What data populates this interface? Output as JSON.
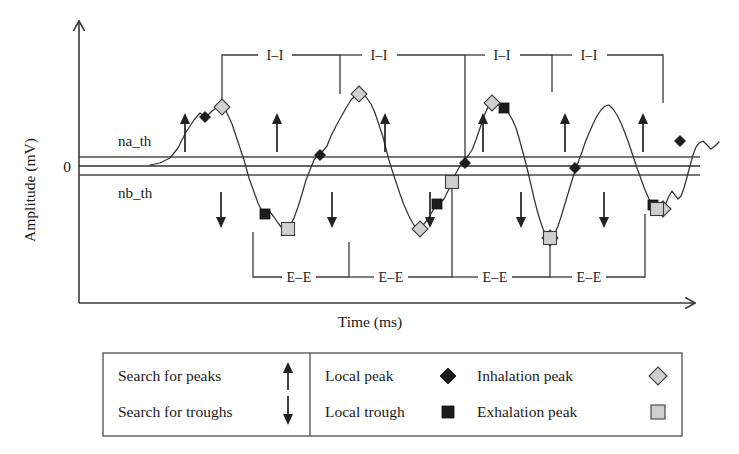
{
  "figure": {
    "type": "annotated-waveform"
  },
  "axes": {
    "y_title": "Amplitude (mV)",
    "x_title": "Time (ms)",
    "zero_tick_label": "0"
  },
  "thresholds": {
    "upper_label": "na_th",
    "lower_label": "nb_th"
  },
  "intervals": {
    "inhalation_label": "I–I",
    "exhalation_label": "E–E",
    "inhalation_count": 4,
    "exhalation_count": 4,
    "inhalation_items": [
      {
        "label": "I–I"
      },
      {
        "label": "I–I"
      },
      {
        "label": "I–I"
      },
      {
        "label": "I–I"
      }
    ],
    "exhalation_items": [
      {
        "label": "E–E"
      },
      {
        "label": "E–E"
      },
      {
        "label": "E–E"
      },
      {
        "label": "E–E"
      }
    ]
  },
  "legend": {
    "items": [
      {
        "label": "Search for peaks",
        "icon": "arrow-up-icon",
        "swatch": "arrow-up"
      },
      {
        "label": "Search for troughs",
        "icon": "arrow-down-icon",
        "swatch": "arrow-down"
      },
      {
        "label": "Local peak",
        "icon": "black-diamond-icon",
        "swatch": "dark-diamond"
      },
      {
        "label": "Local trough",
        "icon": "black-square-icon",
        "swatch": "dark-square"
      },
      {
        "label": "Inhalation peak",
        "icon": "gray-diamond-icon",
        "swatch": "light-diamond"
      },
      {
        "label": "Exhalation peak",
        "icon": "gray-square-icon",
        "swatch": "light-square"
      }
    ]
  },
  "colors": {
    "signal": "#333333",
    "axis": "#3a3a3a",
    "marker_dark": "#1c1c1c",
    "marker_light": "#cfcfcf",
    "marker_light_edge": "#3c3c3c",
    "background": "#ffffff"
  },
  "chart_data": {
    "type": "line",
    "title": "",
    "xlabel": "Time (ms)",
    "ylabel": "Amplitude (mV)",
    "grid": false,
    "legend_position": "bottom",
    "reference_lines": [
      {
        "name": "na_th",
        "y_px": 157
      },
      {
        "name": "zero",
        "y_px": 166,
        "label": "0"
      },
      {
        "name": "nb_th",
        "y_px": 175
      }
    ],
    "series": [
      {
        "name": "Respiratory signal",
        "points_px": [
          [
            150,
            165
          ],
          [
            160,
            163
          ],
          [
            170,
            158
          ],
          [
            178,
            148
          ],
          [
            186,
            132
          ],
          [
            194,
            120
          ],
          [
            200,
            113
          ],
          [
            206,
            117
          ],
          [
            212,
            111
          ],
          [
            219,
            106
          ],
          [
            226,
            111
          ],
          [
            232,
            124
          ],
          [
            238,
            142
          ],
          [
            244,
            160
          ],
          [
            249,
            178
          ],
          [
            254,
            192
          ],
          [
            258,
            203
          ],
          [
            262,
            211
          ],
          [
            266,
            215
          ],
          [
            270,
            212
          ],
          [
            274,
            217
          ],
          [
            278,
            223
          ],
          [
            282,
            228
          ],
          [
            286,
            230
          ],
          [
            290,
            226
          ],
          [
            294,
            218
          ],
          [
            298,
            207
          ],
          [
            302,
            194
          ],
          [
            306,
            180
          ],
          [
            310,
            170
          ],
          [
            314,
            160
          ],
          [
            318,
            155
          ],
          [
            322,
            152
          ],
          [
            327,
            146
          ],
          [
            331,
            136
          ],
          [
            336,
            126
          ],
          [
            341,
            117
          ],
          [
            346,
            108
          ],
          [
            351,
            100
          ],
          [
            356,
            95
          ],
          [
            361,
            93
          ],
          [
            366,
            97
          ],
          [
            371,
            104
          ],
          [
            375,
            113
          ],
          [
            379,
            125
          ],
          [
            383,
            137
          ],
          [
            386,
            149
          ],
          [
            389,
            160
          ],
          [
            392,
            170
          ],
          [
            396,
            182
          ],
          [
            400,
            194
          ],
          [
            404,
            205
          ],
          [
            408,
            214
          ],
          [
            412,
            222
          ],
          [
            416,
            228
          ],
          [
            420,
            229
          ],
          [
            424,
            224
          ],
          [
            428,
            219
          ],
          [
            432,
            212
          ],
          [
            436,
            205
          ],
          [
            440,
            203
          ],
          [
            444,
            199
          ],
          [
            448,
            191
          ],
          [
            452,
            182
          ],
          [
            456,
            173
          ],
          [
            460,
            166
          ],
          [
            464,
            161
          ],
          [
            468,
            156
          ],
          [
            472,
            150
          ],
          [
            476,
            140
          ],
          [
            480,
            128
          ],
          [
            484,
            116
          ],
          [
            488,
            107
          ],
          [
            492,
            103
          ],
          [
            496,
            106
          ],
          [
            500,
            104
          ],
          [
            504,
            107
          ],
          [
            508,
            112
          ],
          [
            512,
            119
          ],
          [
            516,
            128
          ],
          [
            519,
            138
          ],
          [
            522,
            149
          ],
          [
            525,
            160
          ],
          [
            528,
            172
          ],
          [
            531,
            185
          ],
          [
            534,
            198
          ],
          [
            537,
            210
          ],
          [
            540,
            220
          ],
          [
            543,
            229
          ],
          [
            546,
            235
          ],
          [
            549,
            238
          ],
          [
            552,
            237
          ],
          [
            555,
            233
          ],
          [
            558,
            226
          ],
          [
            561,
            217
          ],
          [
            564,
            207
          ],
          [
            567,
            197
          ],
          [
            570,
            187
          ],
          [
            573,
            177
          ],
          [
            576,
            168
          ],
          [
            579,
            160
          ],
          [
            582,
            152
          ],
          [
            585,
            143
          ],
          [
            589,
            133
          ],
          [
            593,
            124
          ],
          [
            597,
            116
          ],
          [
            601,
            110
          ],
          [
            605,
            106
          ],
          [
            609,
            105
          ],
          [
            613,
            109
          ],
          [
            617,
            115
          ],
          [
            621,
            123
          ],
          [
            625,
            133
          ],
          [
            629,
            144
          ],
          [
            633,
            156
          ],
          [
            637,
            168
          ],
          [
            641,
            179
          ],
          [
            645,
            190
          ],
          [
            649,
            199
          ],
          [
            653,
            205
          ],
          [
            657,
            209
          ],
          [
            660,
            212
          ],
          [
            663,
            209
          ],
          [
            666,
            203
          ],
          [
            669,
            196
          ],
          [
            672,
            191
          ],
          [
            675,
            195
          ],
          [
            678,
            199
          ],
          [
            681,
            196
          ],
          [
            684,
            188
          ],
          [
            687,
            177
          ],
          [
            690,
            166
          ],
          [
            693,
            155
          ],
          [
            696,
            147
          ],
          [
            699,
            143
          ],
          [
            703,
            141
          ],
          [
            707,
            145
          ],
          [
            711,
            149
          ],
          [
            715,
            146
          ],
          [
            719,
            142
          ]
        ]
      }
    ],
    "markers": {
      "local_peak": {
        "shape": "diamond",
        "fill": "#1c1c1c",
        "points_px": [
          [
            205,
            117
          ],
          [
            320,
            155
          ],
          [
            465,
            163
          ],
          [
            575,
            168
          ],
          [
            680,
            141
          ]
        ]
      },
      "local_trough": {
        "shape": "square",
        "fill": "#1c1c1c",
        "points_px": [
          [
            265,
            214
          ],
          [
            437,
            204
          ],
          [
            504,
            108
          ],
          [
            653,
            205
          ]
        ]
      },
      "inhalation_peak": {
        "shape": "diamond",
        "fill": "#cfcfcf",
        "points_px": [
          [
            222,
            107
          ],
          [
            359,
            94
          ],
          [
            420,
            229
          ],
          [
            492,
            103
          ],
          [
            550,
            238
          ],
          [
            663,
            209
          ]
        ]
      },
      "exhalation_peak": {
        "shape": "square",
        "fill": "#cfcfcf",
        "points_px": [
          [
            288,
            229
          ],
          [
            452,
            182
          ],
          [
            550,
            238
          ],
          [
            657,
            209
          ]
        ]
      }
    }
  }
}
